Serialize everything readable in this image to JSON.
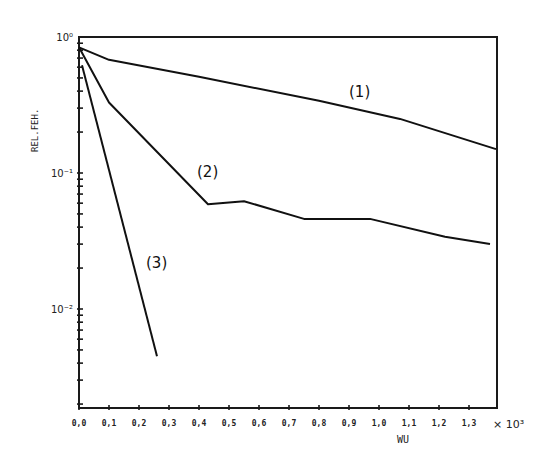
{
  "chart_data": {
    "type": "line",
    "title": "",
    "xlabel": "WU",
    "x_multiplier": "× 10³",
    "ylabel": "REL.FEH.",
    "yscale": "log",
    "xlim": [
      0.0,
      1.38
    ],
    "ylim": [
      0.0019,
      1.0
    ],
    "grid": false,
    "legend": "inline labels",
    "x_ticks": [
      "0,0",
      "0,1",
      "0,2",
      "0,3",
      "0,4",
      "0,5",
      "0,6",
      "0,7",
      "0,8",
      "0,9",
      "1,0",
      "1,1",
      "1,2",
      "1,3"
    ],
    "y_ticks": [
      {
        "label": "10⁰",
        "value": 1.0
      },
      {
        "label": "10⁻¹",
        "value": 0.1
      },
      {
        "label": "10⁻²",
        "value": 0.01
      }
    ],
    "series": [
      {
        "name": "(1)",
        "x": [
          0.0,
          0.1,
          0.4,
          0.8,
          1.07,
          1.39
        ],
        "values": [
          0.84,
          0.68,
          0.51,
          0.34,
          0.25,
          0.15
        ]
      },
      {
        "name": "(2)",
        "x": [
          0.0,
          0.1,
          0.43,
          0.55,
          0.75,
          0.97,
          1.22,
          1.37
        ],
        "values": [
          0.84,
          0.33,
          0.059,
          0.062,
          0.046,
          0.046,
          0.034,
          0.03
        ]
      },
      {
        "name": "(3)",
        "x": [
          0.01,
          0.26
        ],
        "values": [
          0.62,
          0.0045
        ]
      }
    ]
  },
  "labels": {
    "y_axis": "REL.FEH.",
    "x_axis": "WU",
    "x_mult": "× 10³",
    "curve1": "(1)",
    "curve2": "(2)",
    "curve3": "(3)"
  }
}
